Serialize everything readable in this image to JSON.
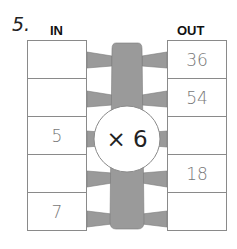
{
  "question_number": "5.",
  "headers": {
    "in": "IN",
    "out": "OUT"
  },
  "operation": "× 6",
  "rows": [
    {
      "in": "",
      "out": "36"
    },
    {
      "in": "",
      "out": "54"
    },
    {
      "in": "5",
      "out": ""
    },
    {
      "in": "",
      "out": "18"
    },
    {
      "in": "7",
      "out": ""
    }
  ],
  "colors": {
    "connector": "#9a9a9a",
    "border": "#8a8a8a",
    "text": "#777777"
  }
}
